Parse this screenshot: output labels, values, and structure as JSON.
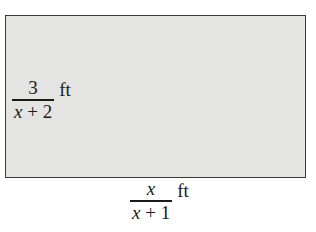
{
  "diagram": {
    "shape": "rectangle",
    "fill_color": "#e4e4e2",
    "border_color": "#3a3a3a",
    "height_label": {
      "numerator": "3",
      "denominator_var": "x",
      "denominator_rest": " + 2",
      "unit": "ft"
    },
    "width_label": {
      "numerator": "x",
      "denominator_var": "x",
      "denominator_rest": " + 1",
      "unit": "ft"
    }
  }
}
